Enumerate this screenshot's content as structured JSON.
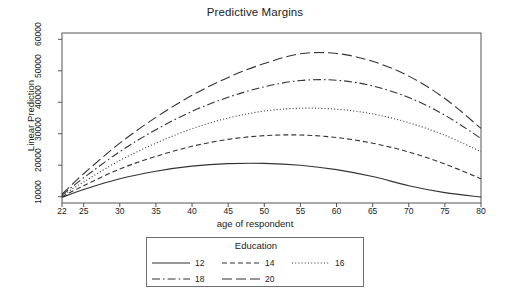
{
  "chart_data": {
    "type": "line",
    "title": "Predictive Margins",
    "xlabel": "age of respondent",
    "ylabel": "Linear Prediction",
    "xlim": [
      22,
      80
    ],
    "ylim": [
      8000,
      62000
    ],
    "grid": false,
    "xticks": [
      22,
      25,
      30,
      35,
      40,
      45,
      50,
      55,
      60,
      65,
      70,
      75,
      80
    ],
    "xtick_labels": [
      "22",
      "25",
      "30",
      "35",
      "40",
      "45",
      "50",
      "55",
      "60",
      "65",
      "70",
      "75",
      "80"
    ],
    "yticks": [
      10000,
      20000,
      30000,
      40000,
      50000,
      60000
    ],
    "ytick_labels": [
      "10000",
      "20000",
      "30000",
      "40000",
      "50000",
      "60000"
    ],
    "legend": {
      "title": "Education",
      "position": "below",
      "entries": [
        {
          "label": "12",
          "style": "solid"
        },
        {
          "label": "14",
          "style": "dashed"
        },
        {
          "label": "16",
          "style": "dotted"
        },
        {
          "label": "18",
          "style": "dash-dot"
        },
        {
          "label": "20",
          "style": "long-dash"
        }
      ]
    },
    "x": [
      22,
      25,
      30,
      35,
      40,
      45,
      50,
      55,
      60,
      65,
      70,
      75,
      80
    ],
    "series": [
      {
        "name": "12",
        "style": "solid",
        "color": "#333333",
        "values": [
          9800,
          12300,
          15700,
          18100,
          19700,
          20500,
          20600,
          20000,
          18600,
          16400,
          13500,
          11300,
          9900
        ]
      },
      {
        "name": "14",
        "style": "dashed",
        "color": "#333333",
        "values": [
          10000,
          13500,
          18800,
          22800,
          26000,
          28200,
          29400,
          29600,
          28800,
          27000,
          24200,
          20400,
          15700
        ]
      },
      {
        "name": "16",
        "style": "dotted",
        "color": "#333333",
        "values": [
          10300,
          14700,
          21500,
          27000,
          31600,
          35000,
          37200,
          38100,
          37800,
          36300,
          33500,
          29500,
          24300
        ]
      },
      {
        "name": "18",
        "style": "dash-dot",
        "color": "#333333",
        "values": [
          10500,
          16000,
          24300,
          31300,
          37100,
          41600,
          44900,
          46900,
          47000,
          45200,
          41500,
          35900,
          28500
        ]
      },
      {
        "name": "20",
        "style": "long-dash",
        "color": "#333333",
        "values": [
          10800,
          17300,
          27000,
          35200,
          42200,
          47900,
          52300,
          55400,
          55500,
          53000,
          48300,
          41200,
          31700
        ]
      }
    ]
  },
  "axes": {
    "frame_color": "#555555"
  }
}
